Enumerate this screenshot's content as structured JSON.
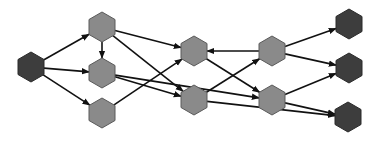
{
  "diagram": {
    "type": "directed-graph",
    "node_shape": "hexagon",
    "colors": {
      "terminal_fill": "#3d3d3d",
      "terminal_stroke": "#2a2a2a",
      "internal_fill": "#8a8a8a",
      "internal_stroke": "#5a5a5a",
      "edge": "#111111",
      "background": "#ffffff"
    },
    "nodes": [
      {
        "id": "src",
        "kind": "terminal",
        "x": 31,
        "y": 67
      },
      {
        "id": "a",
        "kind": "internal",
        "x": 102,
        "y": 27
      },
      {
        "id": "b",
        "kind": "internal",
        "x": 102,
        "y": 73
      },
      {
        "id": "c",
        "kind": "internal",
        "x": 102,
        "y": 113
      },
      {
        "id": "d",
        "kind": "internal",
        "x": 194,
        "y": 51
      },
      {
        "id": "e",
        "kind": "internal",
        "x": 194,
        "y": 100
      },
      {
        "id": "f",
        "kind": "internal",
        "x": 272,
        "y": 51
      },
      {
        "id": "g",
        "kind": "internal",
        "x": 272,
        "y": 100
      },
      {
        "id": "t1",
        "kind": "terminal",
        "x": 349,
        "y": 24
      },
      {
        "id": "t2",
        "kind": "terminal",
        "x": 349,
        "y": 68
      },
      {
        "id": "t3",
        "kind": "terminal",
        "x": 348,
        "y": 117
      }
    ],
    "edges": [
      {
        "from": "src",
        "to": "a"
      },
      {
        "from": "src",
        "to": "b"
      },
      {
        "from": "src",
        "to": "c"
      },
      {
        "from": "a",
        "to": "b"
      },
      {
        "from": "a",
        "to": "d"
      },
      {
        "from": "a",
        "to": "e"
      },
      {
        "from": "b",
        "to": "e"
      },
      {
        "from": "b",
        "to": "g"
      },
      {
        "from": "c",
        "to": "d"
      },
      {
        "from": "f",
        "to": "d"
      },
      {
        "from": "d",
        "to": "g"
      },
      {
        "from": "e",
        "to": "f"
      },
      {
        "from": "e",
        "to": "t3"
      },
      {
        "from": "f",
        "to": "t1"
      },
      {
        "from": "f",
        "to": "t2"
      },
      {
        "from": "g",
        "to": "t2"
      },
      {
        "from": "g",
        "to": "t3"
      }
    ]
  }
}
